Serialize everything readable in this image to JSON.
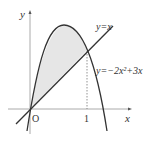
{
  "diagram": {
    "type": "function-graph",
    "axes": {
      "x_label": "x",
      "y_label": "y",
      "origin_label": "O"
    },
    "ticks": {
      "x": [
        "1"
      ]
    },
    "curves": [
      {
        "name": "line",
        "label": "y=x"
      },
      {
        "name": "parabola",
        "label": "y=−2x²+3x"
      }
    ],
    "shaded_region": {
      "between": [
        "parabola",
        "line"
      ],
      "x_from": 0,
      "x_to": 1,
      "fill": "#e6e6e6"
    },
    "colors": {
      "stroke": "#333333",
      "axis": "#aaaaaa",
      "shade": "#e6e6e6"
    }
  }
}
